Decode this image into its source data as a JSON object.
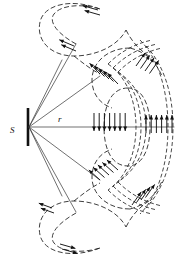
{
  "figure": {
    "width": 175,
    "height": 257,
    "background_color": "#ffffff",
    "line_color": "#1c1c1c",
    "arrow_color": "#111111",
    "ray_color": "#333333"
  },
  "labels": {
    "source": "S",
    "radius": "r"
  },
  "source": {
    "name": "source-bar",
    "x": 28,
    "y_top": 108,
    "y_bottom": 145,
    "label_x": 13,
    "label_y": 131
  },
  "rays": [
    {
      "id": "ray-1",
      "x1": 30,
      "y1": 127,
      "x2": 72,
      "y2": 48
    },
    {
      "id": "ray-2",
      "x1": 30,
      "y1": 127,
      "x2": 100,
      "y2": 85
    },
    {
      "id": "ray-3",
      "x1": 30,
      "y1": 127,
      "x2": 172,
      "y2": 127
    },
    {
      "id": "ray-4",
      "x1": 30,
      "y1": 127,
      "x2": 100,
      "y2": 172
    },
    {
      "id": "ray-5",
      "x1": 30,
      "y1": 127,
      "x2": 72,
      "y2": 208
    },
    {
      "id": "ray-6",
      "x1": 30,
      "y1": 127,
      "x2": 64,
      "y2": 60
    }
  ],
  "radius_label": {
    "x": 60,
    "y": 122
  },
  "arrow_groups": [
    {
      "name": "arrow-group-top-loop",
      "direction": "left",
      "count": 2,
      "angle_deg": 196,
      "length": 16,
      "origin": {
        "x": 98,
        "y": 10
      },
      "spacing": {
        "dx": 2,
        "dy": 5
      }
    },
    {
      "name": "arrow-group-upper-left-pair",
      "direction": "up-left",
      "count": 2,
      "angle_deg": 203,
      "length": 16,
      "origin": {
        "x": 74,
        "y": 46
      },
      "spacing": {
        "dx": 2,
        "dy": 5
      }
    },
    {
      "name": "arrow-group-upper-diagonal",
      "direction": "down-left",
      "count": 5,
      "angle_deg": 226,
      "length": 15,
      "origin": {
        "x": 100,
        "y": 74
      },
      "spacing": {
        "dx": 4.5,
        "dy": 2.5
      }
    },
    {
      "name": "arrow-group-center-down",
      "direction": "down",
      "count": 7,
      "angle_deg": 90,
      "length": 18,
      "origin": {
        "x": 94,
        "y": 113
      },
      "spacing": {
        "dx": 5.2,
        "dy": 0
      }
    },
    {
      "name": "arrow-group-lower-diagonal",
      "direction": "up-left",
      "count": 5,
      "angle_deg": 222,
      "length": 15,
      "origin": {
        "x": 100,
        "y": 180
      },
      "spacing": {
        "dx": 4.5,
        "dy": -2.5
      }
    },
    {
      "name": "arrow-group-bottom-loop",
      "direction": "right",
      "count": 2,
      "angle_deg": 16,
      "length": 16,
      "origin": {
        "x": 60,
        "y": 244
      },
      "spacing": {
        "dx": 2,
        "dy": 5
      }
    },
    {
      "name": "arrow-group-upper-right-diagonal",
      "direction": "up-right",
      "count": 4,
      "angle_deg": 305,
      "length": 16,
      "origin": {
        "x": 136,
        "y": 66
      },
      "spacing": {
        "dx": 4.5,
        "dy": 2.5
      }
    },
    {
      "name": "arrow-group-right-up",
      "direction": "up",
      "count": 7,
      "angle_deg": 270,
      "length": 18,
      "origin": {
        "x": 146,
        "y": 133
      },
      "spacing": {
        "dx": 5.2,
        "dy": 0
      }
    },
    {
      "name": "arrow-group-lower-right-diagonal",
      "direction": "up-right",
      "count": 4,
      "angle_deg": 305,
      "length": 16,
      "origin": {
        "x": 132,
        "y": 205
      },
      "spacing": {
        "dx": 4.5,
        "dy": -2.5
      }
    },
    {
      "name": "arrow-group-bottom-loop-inner",
      "direction": "left",
      "count": 2,
      "angle_deg": 200,
      "length": 14,
      "origin": {
        "x": 52,
        "y": 208
      },
      "spacing": {
        "dx": 2,
        "dy": 5
      }
    }
  ],
  "field_lines": [
    {
      "name": "outer-top-loop",
      "style": "dashed",
      "path": "M 98 12 C 60 0 35 12 40 34 C 44 54 70 62 92 52 C 112 43 125 30 120 16"
    },
    {
      "name": "outer-bottom-loop",
      "style": "dashed",
      "path": "M 98 246 C 60 257 35 246 40 224 C 44 204 70 196 92 206 C 112 215 125 228 120 242"
    },
    {
      "name": "outer-right-arc",
      "style": "dashed",
      "path": "M 120 16 C 150 30 168 70 168 127 C 168 184 150 228 120 242"
    },
    {
      "name": "mid-top-loop",
      "style": "dashed",
      "path": "M 104 44 C 88 50 82 64 90 78 C 97 90 110 94 122 88"
    },
    {
      "name": "mid-bottom-loop",
      "style": "dashed",
      "path": "M 104 214 C 88 208 82 194 90 180 C 97 168 110 164 122 170"
    },
    {
      "name": "inner-oval",
      "style": "dashed",
      "path": "M 120 88 C 104 96 98 110 98 127 C 98 146 104 162 120 170"
    },
    {
      "name": "arc-band-1",
      "style": "dashed",
      "path": "M 108 60 C 128 72 140 96 140 127 C 140 158 128 184 108 196"
    },
    {
      "name": "arc-band-2",
      "style": "dashed",
      "path": "M 112 66 C 132 78 145 100 145 127 C 145 155 132 178 112 190"
    },
    {
      "name": "arc-band-3",
      "style": "dashed",
      "path": "M 116 72 C 136 84 150 104 150 127 C 150 151 136 172 116 184"
    }
  ]
}
